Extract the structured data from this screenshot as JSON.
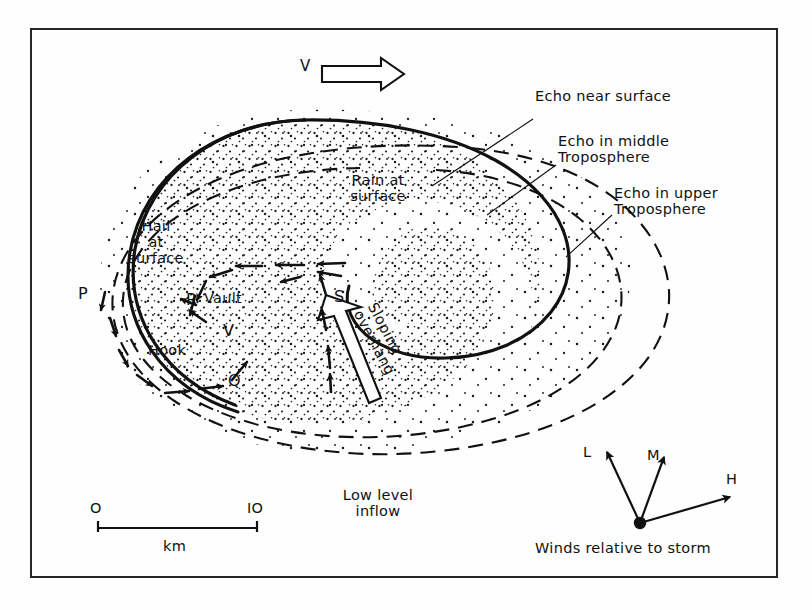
{
  "figure": {
    "frame": {
      "border_color": "#262626"
    }
  },
  "motion": {
    "vector_label": "V",
    "description": "storm motion arrow pointing right"
  },
  "regions": {
    "rain": "Rain at\nsurface",
    "hail": "Hail\nat\nsurface",
    "vault": "Vault",
    "hook": "Hook",
    "sloping_overhang": "Sloping\noverhang"
  },
  "echo_labels": [
    {
      "id": "near-surface",
      "text": "Echo near surface"
    },
    {
      "id": "middle-troposphere",
      "text": "Echo in middle\nTroposphere"
    },
    {
      "id": "upper-troposphere",
      "text": "Echo in upper\nTroposphere"
    }
  ],
  "points": [
    {
      "id": "P",
      "label": "P"
    },
    {
      "id": "Q",
      "label": "Q"
    },
    {
      "id": "R",
      "label": "R"
    },
    {
      "id": "S",
      "label": "S"
    },
    {
      "id": "V",
      "label": "V"
    }
  ],
  "inflow": {
    "label": "Low level\ninflow"
  },
  "scale": {
    "start": "O",
    "end": "IO",
    "units": "km",
    "start_value": 0,
    "end_value": 10
  },
  "wind_inset": {
    "caption": "Winds relative to storm",
    "vectors": [
      {
        "id": "L",
        "label": "L",
        "level": "low",
        "dx": -52,
        "dy": -78
      },
      {
        "id": "M",
        "label": "M",
        "level": "middle",
        "dx": 28,
        "dy": -72
      },
      {
        "id": "H",
        "label": "H",
        "level": "high",
        "dx": 104,
        "dy": -28
      }
    ]
  },
  "colors": {
    "ink": "#111111",
    "frame": "#262626",
    "stipple": "#1a1a1a"
  }
}
